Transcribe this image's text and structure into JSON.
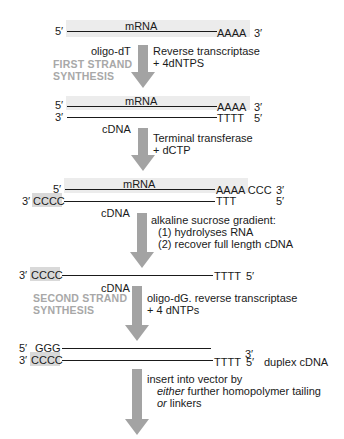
{
  "diagram": {
    "colors": {
      "strand": "#1a1a1a",
      "arrow": "#a3a3a3",
      "mrna_band": "#ececec",
      "tail_box": "#d9d9d9",
      "stage_label": "#a8a8a8"
    },
    "row1": {
      "five_prime": "5′",
      "strand_label": "mRNA",
      "tail": "AAAA",
      "three_prime": "3′"
    },
    "step1": {
      "primer": "oligo-dT",
      "stage_label_line1": "FIRST STRAND",
      "stage_label_line2": "SYNTHESIS",
      "reagent_line1": "Reverse transcriptase",
      "reagent_line2": "+ 4dNTPS"
    },
    "row2": {
      "top": {
        "five_prime": "5′",
        "label": "mRNA",
        "tail": "AAAA",
        "three_prime": "3′"
      },
      "bottom": {
        "three_prime": "3′",
        "tail": "TTTT",
        "five_prime": "5′",
        "label": "cDNA"
      }
    },
    "step2": {
      "reagent_line1": "Terminal transferase",
      "reagent_line2": "+ dCTP"
    },
    "row3": {
      "top": {
        "five_prime": "5′",
        "label": "mRNA",
        "tail": "AAAA CCC",
        "three_prime": "3′"
      },
      "bottom": {
        "three_prime": "3′",
        "head": "CCCC",
        "tail": "TTT",
        "five_prime": "5′",
        "label": "cDNA"
      }
    },
    "step3": {
      "line1": "alkaline sucrose gradient:",
      "line2": "(1) hydrolyses RNA",
      "line3": "(2) recover full length cDNA"
    },
    "row4": {
      "three_prime": "3′",
      "head": "CCCC",
      "tail": "TTTT",
      "five_prime": "5′",
      "label": "cDNA"
    },
    "step4": {
      "stage_label_line1": "SECOND STRAND",
      "stage_label_line2": "SYNTHESIS",
      "reagent_line1": "oligo-dG. reverse transcriptase",
      "reagent_line2": "+ 4 dNTPs"
    },
    "row5": {
      "top": {
        "five_prime": "5′",
        "head": "GGG",
        "three_prime": "3′"
      },
      "bottom": {
        "three_prime": "3′",
        "head": "CCCC",
        "tail": "TTTT",
        "five_prime": "5′"
      },
      "label": "duplex cDNA"
    },
    "step5": {
      "line1": "insert into vector by",
      "line2_em": "either",
      "line2_rest": " further homopolymer tailing",
      "line3_em": "or",
      "line3_rest": " linkers"
    }
  }
}
